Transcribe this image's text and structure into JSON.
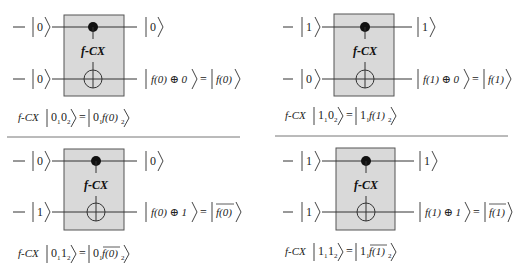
{
  "gate_label": "f-CX",
  "operator_prefix": "f-CX",
  "colors": {
    "gate_fill": "#d9d9d9",
    "gate_stroke": "#555555",
    "wire": "#333333",
    "separator": "#777777"
  },
  "panels": [
    {
      "id": "top-left",
      "inputs": {
        "control": "0",
        "target": "0"
      },
      "outputs": {
        "control": "0",
        "target_lhs": "f(0) ⊕ 0",
        "target_rhs": "f(0)",
        "target_rhs_overline": false
      },
      "equation": {
        "lhs": [
          "0",
          "1",
          "0",
          "2"
        ],
        "rhs_first": "0",
        "rhs_first_sub": "1",
        "rhs_second": "f(0)",
        "rhs_second_sub": "2",
        "rhs_overline": false
      }
    },
    {
      "id": "top-right",
      "inputs": {
        "control": "1",
        "target": "0"
      },
      "outputs": {
        "control": "1",
        "target_lhs": "f(1) ⊕ 0",
        "target_rhs": "f(1)",
        "target_rhs_overline": false
      },
      "equation": {
        "lhs": [
          "1",
          "1",
          "0",
          "2"
        ],
        "rhs_first": "1",
        "rhs_first_sub": "1",
        "rhs_second": "f(1)",
        "rhs_second_sub": "2",
        "rhs_overline": false
      }
    },
    {
      "id": "bottom-left",
      "inputs": {
        "control": "0",
        "target": "1"
      },
      "outputs": {
        "control": "0",
        "target_lhs": "f(0) ⊕ 1",
        "target_rhs": "f(0)",
        "target_rhs_overline": true
      },
      "equation": {
        "lhs": [
          "0",
          "1",
          "1",
          "2"
        ],
        "rhs_first": "0",
        "rhs_first_sub": "1",
        "rhs_second": "f(0)",
        "rhs_second_sub": "2",
        "rhs_overline": true
      }
    },
    {
      "id": "bottom-right",
      "inputs": {
        "control": "1",
        "target": "1"
      },
      "outputs": {
        "control": "1",
        "target_lhs": "f(1) ⊕ 1",
        "target_rhs": "f(1)",
        "target_rhs_overline": true
      },
      "equation": {
        "lhs": [
          "1",
          "1",
          "1",
          "2"
        ],
        "rhs_first": "1",
        "rhs_first_sub": "1",
        "rhs_second": "f(1)",
        "rhs_second_sub": "2",
        "rhs_overline": true
      }
    }
  ]
}
